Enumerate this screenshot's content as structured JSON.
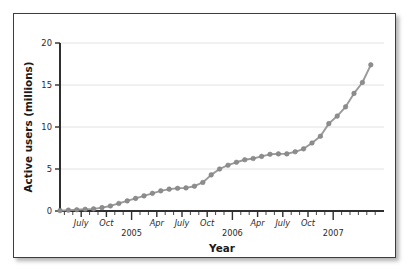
{
  "chart_data": {
    "type": "line",
    "title": "",
    "xlabel": "Year",
    "ylabel": "Active users (millions)",
    "ylim": [
      0,
      20
    ],
    "yticks": [
      0,
      5,
      10,
      15,
      20
    ],
    "ytick_labels": [
      "0",
      "5",
      "10",
      "15",
      "20"
    ],
    "grid": true,
    "grid_axis": "y",
    "legend": false,
    "marker": "circle",
    "line_color": "#9a9a9a",
    "marker_color": "#8d8d8d",
    "x_tick_interval": "monthly",
    "x_major_labels": [
      {
        "x": "2004-07",
        "label": "July"
      },
      {
        "x": "2004-10",
        "label": "Oct"
      },
      {
        "x": "2005-04",
        "label": "Apr"
      },
      {
        "x": "2005-07",
        "label": "July"
      },
      {
        "x": "2005-10",
        "label": "Oct"
      },
      {
        "x": "2006-04",
        "label": "Apr"
      },
      {
        "x": "2006-07",
        "label": "July"
      },
      {
        "x": "2006-10",
        "label": "Oct"
      }
    ],
    "x_year_labels": [
      {
        "x": "2005-01",
        "label": "2005"
      },
      {
        "x": "2006-01",
        "label": "2006"
      },
      {
        "x": "2007-01",
        "label": "2007"
      }
    ],
    "x": [
      "2004-05",
      "2004-06",
      "2004-07",
      "2004-08",
      "2004-09",
      "2004-10",
      "2004-11",
      "2004-12",
      "2005-01",
      "2005-02",
      "2005-03",
      "2005-04",
      "2005-05",
      "2005-06",
      "2005-07",
      "2005-08",
      "2005-09",
      "2005-10",
      "2005-11",
      "2005-12",
      "2006-01",
      "2006-02",
      "2006-03",
      "2006-04",
      "2006-05",
      "2006-06",
      "2006-07",
      "2006-08",
      "2006-09",
      "2006-10",
      "2006-11",
      "2006-12",
      "2007-01",
      "2007-02",
      "2007-03",
      "2007-04",
      "2007-05"
    ],
    "values": [
      0.05,
      0.1,
      0.15,
      0.2,
      0.25,
      0.4,
      0.6,
      0.9,
      1.2,
      1.5,
      1.8,
      2.1,
      2.4,
      2.6,
      2.7,
      2.75,
      2.95,
      3.4,
      4.3,
      5.0,
      5.45,
      5.8,
      6.1,
      6.25,
      6.5,
      6.75,
      6.8,
      6.8,
      7.05,
      7.4,
      8.1,
      8.9,
      10.4,
      11.3,
      12.4,
      14.0,
      15.3
    ],
    "final_value": 17.4,
    "final_x": "2007-06",
    "units": "millions"
  }
}
